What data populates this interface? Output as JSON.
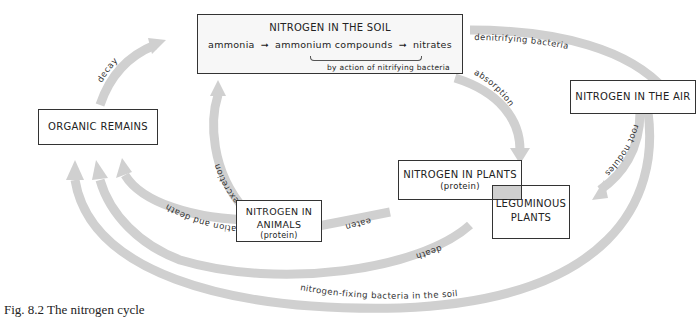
{
  "figure": {
    "caption": "Fig. 8.2   The nitrogen cycle"
  },
  "nodes": {
    "soil": {
      "title": "NITROGEN IN THE SOIL",
      "chain": [
        "ammonia",
        "ammonium compounds",
        "nitrates"
      ],
      "note": "by action of nitrifying bacteria"
    },
    "air": {
      "title": "NITROGEN  IN THE  AIR"
    },
    "organic": {
      "title": "ORGANIC  REMAINS"
    },
    "plants": {
      "title": "NITROGEN IN PLANTS",
      "sub": "(protein)"
    },
    "legumes": {
      "line1": "LEGUMINOUS",
      "line2": "PLANTS"
    },
    "animals": {
      "line1": "NITROGEN IN",
      "line2": "ANIMALS",
      "sub": "(protein)"
    }
  },
  "arrows": {
    "denitrifying": "denitrifying bacteria",
    "absorption": "absorption",
    "root_nodules": "root nodules",
    "decay": "decay",
    "excretion": "excretion",
    "defecation": "defecation and death",
    "eaten": "eaten",
    "death": "death",
    "fixing": "nitrogen-fixing bacteria in the soil"
  },
  "colors": {
    "arrow": "#cfcfcf",
    "box_border": "#333333",
    "soil_fill": "#f7f7f7"
  }
}
